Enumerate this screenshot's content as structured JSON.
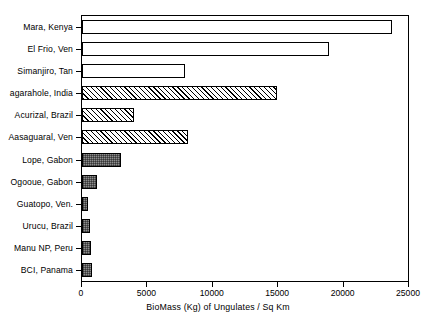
{
  "chart_data": {
    "type": "bar",
    "orientation": "horizontal",
    "title": "",
    "xlabel": "BioMass (Kg) of Ungulates / Sq Km",
    "ylabel": "",
    "xlim": [
      0,
      25000
    ],
    "xticks": [
      0,
      5000,
      10000,
      15000,
      20000,
      25000
    ],
    "xtick_labels": [
      "0",
      "5000",
      "10000",
      "15000",
      "20000",
      "25000"
    ],
    "grid": false,
    "legend": "none",
    "categories": [
      "Mara, Kenya",
      "El Frio, Ven",
      "Simanjiro, Tan",
      "agarahole, India",
      "Acurizal, Brazil",
      "Aasaguaral, Ven",
      "Lope, Gabon",
      "Ogooue, Gabon",
      "Guatopo, Ven.",
      "Urucu, Brazil",
      "Manu NP, Peru",
      "BCI, Panama"
    ],
    "values": [
      23700,
      18900,
      7900,
      14900,
      4000,
      8100,
      3000,
      1150,
      450,
      600,
      700,
      780
    ],
    "bar_fills": [
      "open",
      "open",
      "open",
      "hatch",
      "hatch",
      "hatch",
      "stipple",
      "stipple",
      "stipple",
      "stipple",
      "stipple",
      "stipple"
    ],
    "colors": {
      "axis": "#000000",
      "bar_outline": "#000000",
      "bar_open_fill": "#ffffff",
      "bar_hatch_fill": "#ffffff",
      "bar_stipple_fill": "#8e8e8e",
      "background": "#ffffff"
    }
  }
}
